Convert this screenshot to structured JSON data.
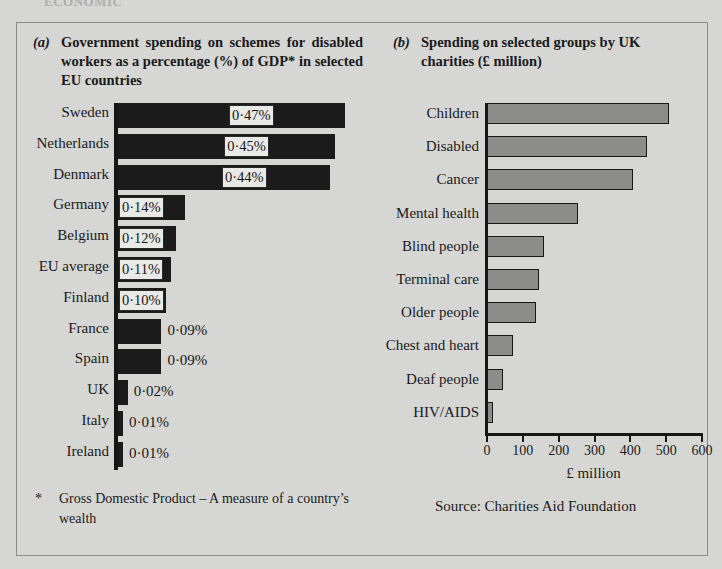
{
  "page": {
    "background_color": "#d6d6d4",
    "frame_color": "#8b8b89",
    "top_crop_text": "ECONOMIC"
  },
  "panel_a": {
    "tag": "(a)",
    "title": "Government spending on schemes for disabled workers as a percentage (%) of GDP* in selected EU countries",
    "footnote_marker": "*",
    "footnote": "Gross Domestic Product – A measure of a country’s wealth"
  },
  "panel_b": {
    "tag": "(b)",
    "title": "Spending on selected groups by UK charities (£ million)",
    "source": "Source:  Charities Aid Foundation"
  },
  "chart_data": [
    {
      "type": "bar",
      "orientation": "horizontal",
      "id": "chart-a",
      "title": "Government spending on schemes for disabled workers as a percentage (%) of GDP* in selected EU countries",
      "xlabel": "",
      "ylabel": "",
      "xlim": [
        0,
        0.5
      ],
      "grid": false,
      "legend": null,
      "bar_color": "#1b1b1b",
      "value_suffix": "%",
      "categories": [
        "Sweden",
        "Netherlands",
        "Denmark",
        "Germany",
        "Belgium",
        "EU average",
        "Finland",
        "France",
        "Spain",
        "UK",
        "Italy",
        "Ireland"
      ],
      "values": [
        0.47,
        0.45,
        0.44,
        0.14,
        0.12,
        0.11,
        0.1,
        0.09,
        0.09,
        0.02,
        0.01,
        0.01
      ],
      "labels": [
        "0·47%",
        "0·45%",
        "0·44%",
        "0·14%",
        "0·12%",
        "0·11%",
        "0·10%",
        "0·09%",
        "0·09%",
        "0·02%",
        "0·01%",
        "0·01%"
      ],
      "label_inside": [
        true,
        true,
        true,
        true,
        true,
        true,
        true,
        false,
        false,
        false,
        false,
        false
      ]
    },
    {
      "type": "bar",
      "orientation": "horizontal",
      "id": "chart-b",
      "title": "Spending on selected groups by UK charities (£ million)",
      "xlabel": "£ million",
      "ylabel": "",
      "xlim": [
        0,
        600
      ],
      "xticks": [
        0,
        100,
        200,
        300,
        400,
        500,
        600
      ],
      "xticklabels": [
        "0",
        "100",
        "200",
        "300",
        "400",
        "500",
        "600"
      ],
      "grid": false,
      "legend": null,
      "bar_color": "#8c8c8a",
      "bar_edge_color": "#171717",
      "categories": [
        "Children",
        "Disabled",
        "Cancer",
        "Mental health",
        "Blind people",
        "Terminal care",
        "Older people",
        "Chest and heart",
        "Deaf people",
        "HIV/AIDS"
      ],
      "values": [
        508,
        447,
        408,
        255,
        160,
        145,
        138,
        72,
        45,
        18
      ]
    }
  ]
}
